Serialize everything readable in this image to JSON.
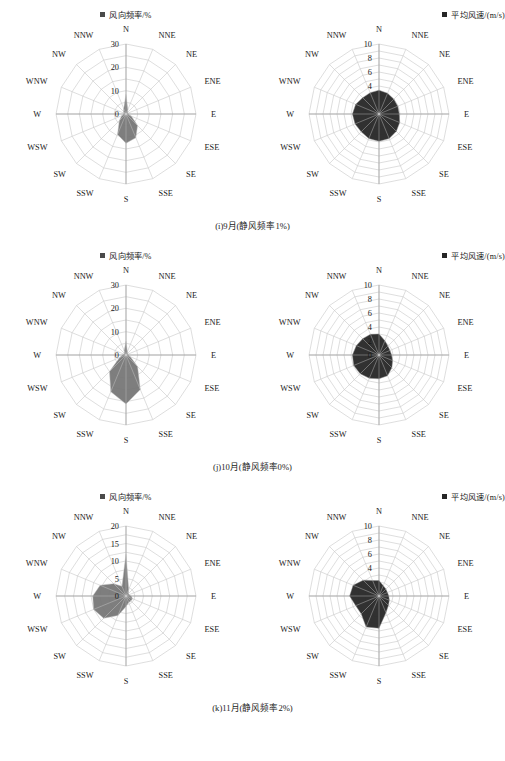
{
  "figure": {
    "title_present": false,
    "rows": [
      {
        "id": "row-i",
        "caption": "(i)9月(静风频率1%)",
        "left": {
          "legend": "风向频率/%",
          "legend_color": "#737373"
        },
        "right": {
          "legend": "平均风速/(m/s)",
          "legend_color": "#262626"
        }
      },
      {
        "id": "row-j",
        "caption": "(j)10月(静风频率0%)",
        "left": {
          "legend": "风向频率/%",
          "legend_color": "#737373"
        },
        "right": {
          "legend": "平均风速/(m/s)",
          "legend_color": "#262626"
        }
      },
      {
        "id": "row-k",
        "caption": "(k)11月(静风频率2%)",
        "left": {
          "legend": "风向频率/%",
          "legend_color": "#737373"
        },
        "right": {
          "legend": "平均风速/(m/s)",
          "legend_color": "#262626"
        }
      }
    ]
  },
  "directions": [
    "N",
    "NNE",
    "NE",
    "ENE",
    "E",
    "ESE",
    "SE",
    "SSE",
    "S",
    "SSW",
    "SW",
    "WSW",
    "W",
    "WNW",
    "NW",
    "NNW"
  ],
  "chart_data": [
    {
      "id": "i-freq",
      "type": "radar",
      "title": "(i)9月 风向频率",
      "ylabel": "风向频率/%",
      "legend": [
        "风向频率/%"
      ],
      "categories": [
        "N",
        "NNE",
        "NE",
        "ENE",
        "E",
        "ESE",
        "SE",
        "SSE",
        "S",
        "SSW",
        "SW",
        "WSW",
        "W",
        "WNW",
        "NW",
        "NNW"
      ],
      "values": [
        8.5,
        2.0,
        1.0,
        1.0,
        1.0,
        2.5,
        7.0,
        11.0,
        12.5,
        9.5,
        4.0,
        2.0,
        1.0,
        1.0,
        1.5,
        2.5
      ],
      "rticks": [
        0,
        10,
        20,
        30
      ],
      "rlim": [
        0,
        30
      ],
      "grid": true,
      "legend_position": "top-center"
    },
    {
      "id": "i-speed",
      "type": "radar",
      "title": "(i)9月 平均风速",
      "ylabel": "平均风速/(m/s)",
      "legend": [
        "平均风速/(m/s)"
      ],
      "categories": [
        "N",
        "NNE",
        "NE",
        "ENE",
        "E",
        "ESE",
        "SE",
        "SSE",
        "S",
        "SSW",
        "SW",
        "WSW",
        "W",
        "WNW",
        "NW",
        "NNW"
      ],
      "values": [
        3.4,
        3.2,
        3.0,
        2.9,
        2.9,
        3.2,
        3.5,
        3.8,
        3.9,
        3.8,
        3.6,
        3.7,
        3.8,
        3.6,
        3.3,
        3.3
      ],
      "rticks": [
        4,
        6,
        8,
        10
      ],
      "rlim": [
        0,
        10
      ],
      "grid": true,
      "legend_position": "top-right"
    },
    {
      "id": "j-freq",
      "type": "radar",
      "title": "(j)10月 风向频率",
      "ylabel": "风向频率/%",
      "legend": [
        "风向频率/%"
      ],
      "categories": [
        "N",
        "NNE",
        "NE",
        "ENE",
        "E",
        "ESE",
        "SE",
        "SSE",
        "S",
        "SSW",
        "SW",
        "WSW",
        "W",
        "WNW",
        "NW",
        "NNW"
      ],
      "values": [
        6.0,
        1.5,
        1.0,
        1.0,
        1.0,
        2.0,
        7.0,
        16.0,
        21.0,
        17.0,
        10.0,
        3.0,
        1.5,
        1.0,
        1.0,
        2.0
      ],
      "rticks": [
        0,
        10,
        20,
        30
      ],
      "rlim": [
        0,
        30
      ],
      "grid": true,
      "legend_position": "top-center"
    },
    {
      "id": "j-speed",
      "type": "radar",
      "title": "(j)10月 平均风速",
      "ylabel": "平均风速/(m/s)",
      "legend": [
        "平均风速/(m/s)"
      ],
      "categories": [
        "N",
        "NNE",
        "NE",
        "ENE",
        "E",
        "ESE",
        "SE",
        "SSE",
        "S",
        "SSW",
        "SW",
        "WSW",
        "W",
        "WNW",
        "NW",
        "NNW"
      ],
      "values": [
        3.0,
        2.2,
        1.8,
        1.7,
        1.8,
        2.1,
        2.6,
        3.2,
        3.4,
        3.6,
        3.8,
        3.9,
        3.8,
        3.5,
        3.3,
        3.2
      ],
      "rticks": [
        0,
        2,
        4,
        6,
        8,
        10
      ],
      "rlim": [
        0,
        10
      ],
      "grid": true,
      "legend_position": "top-right"
    },
    {
      "id": "k-freq",
      "type": "radar",
      "title": "(k)11月 风向频率",
      "ylabel": "风向频率/%",
      "legend": [
        "风向频率/%"
      ],
      "categories": [
        "N",
        "NNE",
        "NE",
        "ENE",
        "E",
        "ESE",
        "SE",
        "SSE",
        "S",
        "SSW",
        "SW",
        "WSW",
        "W",
        "WNW",
        "NW",
        "NNW"
      ],
      "values": [
        12.0,
        2.0,
        1.0,
        1.0,
        1.5,
        2.0,
        2.0,
        2.0,
        3.0,
        6.0,
        9.0,
        10.0,
        9.5,
        8.0,
        5.0,
        3.0
      ],
      "rticks": [
        0,
        5,
        10,
        15,
        20
      ],
      "rlim": [
        0,
        20
      ],
      "grid": true,
      "legend_position": "top-center"
    },
    {
      "id": "k-speed",
      "type": "radar",
      "title": "(k)11月 平均风速",
      "ylabel": "平均风速/(m/s)",
      "legend": [
        "平均风速/(m/s)"
      ],
      "categories": [
        "N",
        "NNE",
        "NE",
        "ENE",
        "E",
        "ESE",
        "SE",
        "SSE",
        "S",
        "SSW",
        "SW",
        "WSW",
        "W",
        "WNW",
        "NW",
        "NNW"
      ],
      "values": [
        2.2,
        1.6,
        1.4,
        1.3,
        1.4,
        1.6,
        1.9,
        2.6,
        4.6,
        4.8,
        3.6,
        3.6,
        4.2,
        4.0,
        3.2,
        2.4
      ],
      "rticks": [
        4,
        6,
        8,
        10
      ],
      "rlim": [
        0,
        10
      ],
      "grid": true,
      "legend_position": "top-right"
    }
  ]
}
